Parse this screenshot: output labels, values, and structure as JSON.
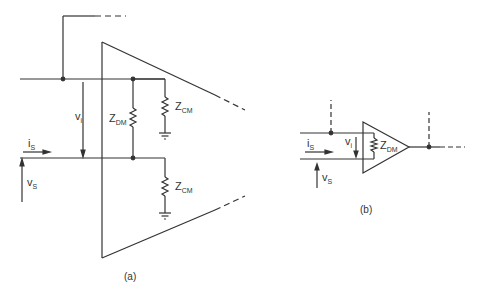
{
  "figure_a": {
    "caption": "(a)",
    "labels": {
      "vi": "v",
      "vi_sub": "i",
      "is": "i",
      "is_sub": "S",
      "vs": "v",
      "vs_sub": "S",
      "zdm": "Z",
      "zdm_sub": "DM",
      "zcm_top": "Z",
      "zcm_top_sub": "CM",
      "zcm_bot": "Z",
      "zcm_bot_sub": "CM"
    }
  },
  "figure_b": {
    "caption": "(b)",
    "labels": {
      "vi": "v",
      "vi_sub": "i",
      "is": "i",
      "is_sub": "S",
      "vs": "v",
      "vs_sub": "S",
      "zdm": "Z",
      "zdm_sub": "DM"
    }
  },
  "colors": {
    "line": "#333333"
  }
}
